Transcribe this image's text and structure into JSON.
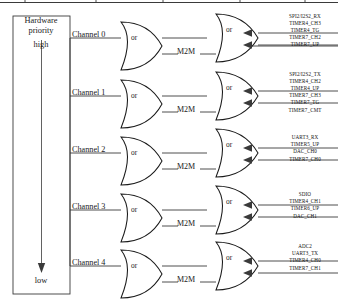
{
  "diagram": {
    "priority_box": {
      "title_line1": "Hardware",
      "title_line2": "priority",
      "high_label": "high",
      "low_label": "low",
      "arrow_icon": "down-arrow-icon"
    },
    "gate_label": "or",
    "m2m_label": "M2M",
    "channels": [
      {
        "name": "Channel 0",
        "signals": [
          "SPI2/I2S2_RX",
          "TIMER4_CH3",
          "TIMER4_TG",
          "TIMER7_CH2",
          "TIMER7_UP"
        ]
      },
      {
        "name": "Channel 1",
        "signals": [
          "SPI2/I2S2_TX",
          "TIMER4_CH2",
          "TIMER4_UP",
          "TIMER7_CH3",
          "TIMER7_TG",
          "TIMER7_CMT"
        ]
      },
      {
        "name": "Channel 2",
        "signals": [
          "UART3_RX",
          "TIMER5_UP",
          "DAC_CH0",
          "TIMER7_CH0"
        ]
      },
      {
        "name": "Channel 3",
        "signals": [
          "SDIO",
          "TIMER4_CH1",
          "TIMER6_UP",
          "DAC_CH1"
        ]
      },
      {
        "name": "Channel 4",
        "signals": [
          "ADC2",
          "UART3_TX",
          "TIMER4_CH0",
          "TIMER7_CH1"
        ]
      }
    ]
  },
  "colors": {
    "line": "#3a3a3a",
    "text": "#111111",
    "background": "#ffffff"
  }
}
